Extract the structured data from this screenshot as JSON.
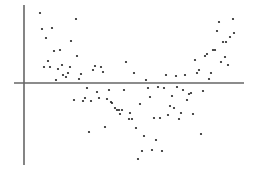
{
  "chart_data": {
    "type": "scatter",
    "title": "",
    "xlabel": "",
    "ylabel": "",
    "grid": false,
    "legend": null,
    "colors": {
      "background": "#ffffff",
      "axis": "#333333",
      "hline": "#666666",
      "point": "#222222"
    },
    "axes": {
      "y_axis": {
        "x": 24,
        "y1": 5,
        "y2": 165
      },
      "zero_line": {
        "y": 83,
        "x1": 14,
        "x2": 244
      }
    },
    "points_px": [
      [
        40,
        13
      ],
      [
        76,
        19
      ],
      [
        42,
        29
      ],
      [
        52,
        28
      ],
      [
        46,
        38
      ],
      [
        71,
        41
      ],
      [
        54,
        51
      ],
      [
        60,
        50
      ],
      [
        77,
        56
      ],
      [
        48,
        61
      ],
      [
        44,
        67
      ],
      [
        50,
        67
      ],
      [
        62,
        65
      ],
      [
        58,
        69
      ],
      [
        70,
        67
      ],
      [
        63,
        75
      ],
      [
        66,
        77
      ],
      [
        68,
        73
      ],
      [
        56,
        80
      ],
      [
        79,
        79
      ],
      [
        81,
        74
      ],
      [
        95,
        66
      ],
      [
        93,
        70
      ],
      [
        101,
        67
      ],
      [
        103,
        72
      ],
      [
        87,
        88
      ],
      [
        126,
        62
      ],
      [
        134,
        73
      ],
      [
        146,
        80
      ],
      [
        148,
        88
      ],
      [
        158,
        87
      ],
      [
        164,
        88
      ],
      [
        177,
        87
      ],
      [
        166,
        75
      ],
      [
        176,
        76
      ],
      [
        185,
        75
      ],
      [
        195,
        60
      ],
      [
        197,
        73
      ],
      [
        199,
        70
      ],
      [
        205,
        56
      ],
      [
        207,
        54
      ],
      [
        209,
        79
      ],
      [
        211,
        73
      ],
      [
        213,
        50
      ],
      [
        215,
        50
      ],
      [
        221,
        62
      ],
      [
        225,
        57
      ],
      [
        228,
        65
      ],
      [
        217,
        31
      ],
      [
        219,
        22
      ],
      [
        223,
        42
      ],
      [
        226,
        42
      ],
      [
        230,
        37
      ],
      [
        234,
        33
      ],
      [
        233,
        19
      ],
      [
        74,
        100
      ],
      [
        83,
        101
      ],
      [
        85,
        98
      ],
      [
        91,
        101
      ],
      [
        97,
        92
      ],
      [
        99,
        98
      ],
      [
        107,
        99
      ],
      [
        109,
        90
      ],
      [
        111,
        102
      ],
      [
        112,
        103
      ],
      [
        115,
        108
      ],
      [
        117,
        110
      ],
      [
        119,
        110
      ],
      [
        122,
        110
      ],
      [
        120,
        114
      ],
      [
        89,
        132
      ],
      [
        105,
        127
      ],
      [
        124,
        90
      ],
      [
        140,
        104
      ],
      [
        150,
        97
      ],
      [
        172,
        96
      ],
      [
        183,
        90
      ],
      [
        189,
        94
      ],
      [
        191,
        93
      ],
      [
        187,
        100
      ],
      [
        203,
        91
      ],
      [
        170,
        106
      ],
      [
        174,
        108
      ],
      [
        181,
        113
      ],
      [
        193,
        114
      ],
      [
        168,
        115
      ],
      [
        179,
        119
      ],
      [
        130,
        113
      ],
      [
        129,
        119
      ],
      [
        132,
        119
      ],
      [
        154,
        118
      ],
      [
        160,
        118
      ],
      [
        136,
        128
      ],
      [
        144,
        136
      ],
      [
        156,
        140
      ],
      [
        142,
        151
      ],
      [
        152,
        150
      ],
      [
        162,
        151
      ],
      [
        138,
        159
      ],
      [
        201,
        134
      ]
    ]
  }
}
